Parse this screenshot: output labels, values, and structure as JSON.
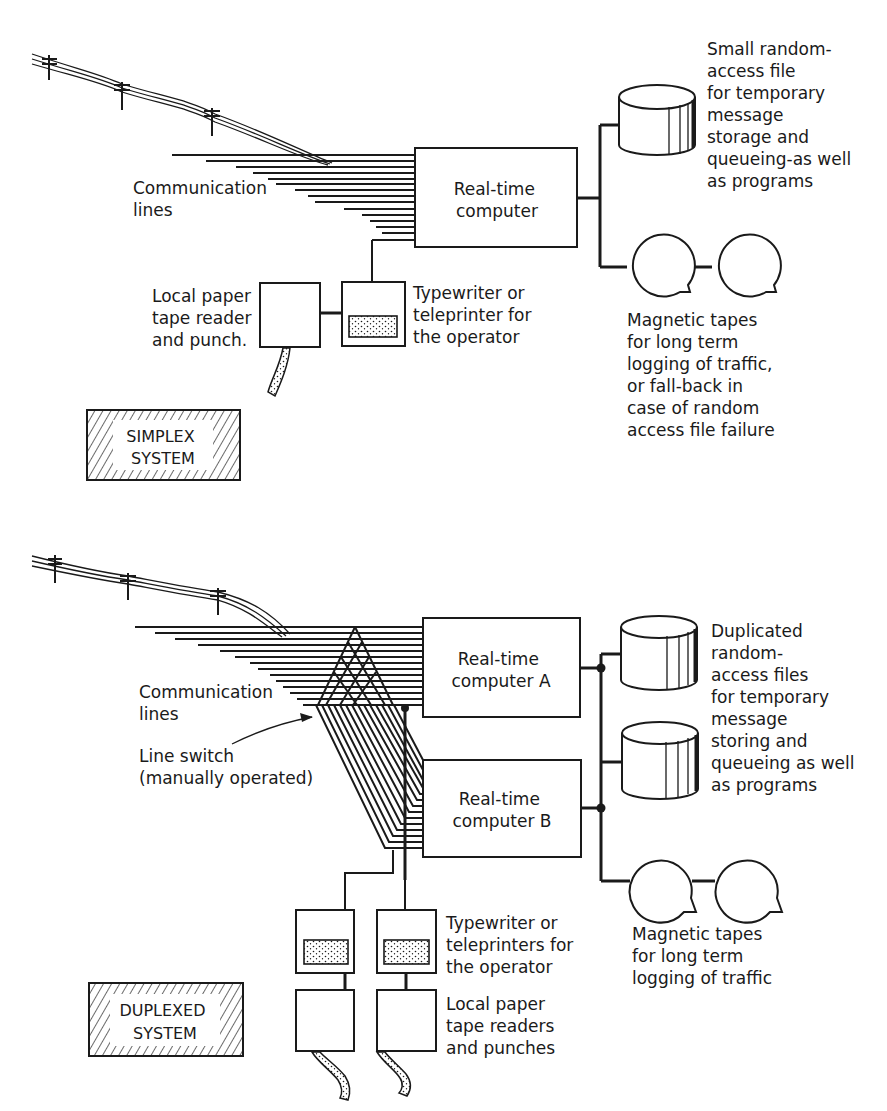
{
  "simplex": {
    "badge": [
      "SIMPLEX",
      "SYSTEM"
    ],
    "communication_lines_label": [
      "Communication",
      "lines"
    ],
    "computer_label": [
      "Real-time",
      "computer"
    ],
    "disk_label": [
      "Small random-",
      "access file",
      "for temporary",
      "message",
      "storage and",
      "queueing-as well",
      "as programs"
    ],
    "tapes_label": [
      "Magnetic tapes",
      "for long term",
      "logging of traffic,",
      "or fall-back in",
      "case of random",
      "access file failure"
    ],
    "typewriter_label": [
      "Typewriter or",
      "teleprinter for",
      "the operator"
    ],
    "paper_tape_label": [
      "Local paper",
      "tape reader",
      "and punch."
    ]
  },
  "duplex": {
    "badge": [
      "DUPLEXED",
      "SYSTEM"
    ],
    "communication_lines_label": [
      "Communication",
      "lines"
    ],
    "line_switch_label": [
      "Line switch",
      "(manually operated)"
    ],
    "computer_a_label": [
      "Real-time",
      "computer A"
    ],
    "computer_b_label": [
      "Real-time",
      "computer B"
    ],
    "disk_label": [
      "Duplicated",
      "random-",
      "access files",
      "for temporary",
      "message",
      "storing and",
      "queueing as well",
      "as programs"
    ],
    "tapes_label": [
      "Magnetic tapes",
      "for long term",
      "logging of traffic"
    ],
    "typewriter_label": [
      "Typewriter or",
      "teleprinters for",
      "the operator"
    ],
    "paper_tape_label": [
      "Local paper",
      "tape readers",
      "and punches"
    ]
  },
  "colors": {
    "ink": "#1a1a1a",
    "paper": "#ffffff"
  }
}
